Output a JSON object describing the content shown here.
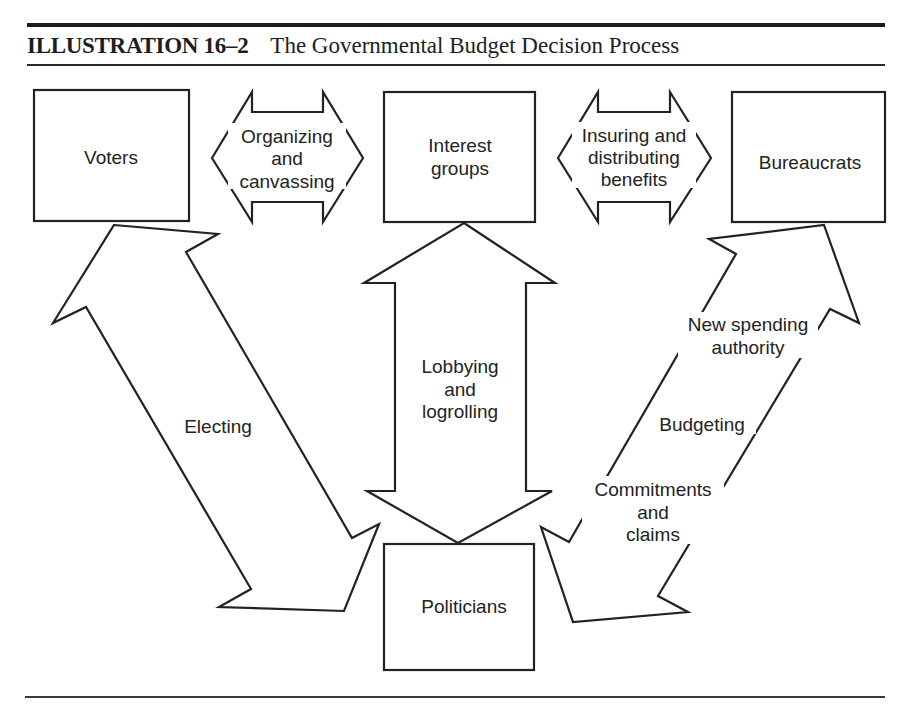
{
  "header": {
    "illustration_number": "ILLUSTRATION 16–2",
    "title": "The Governmental Budget Decision Process"
  },
  "nodes": {
    "voters": "Voters",
    "interest_groups": [
      "Interest",
      "groups"
    ],
    "bureaucrats": "Bureaucrats",
    "politicians": "Politicians"
  },
  "arrows": {
    "organizing": [
      "Organizing",
      "and",
      "canvassing"
    ],
    "insuring": [
      "Insuring and",
      "distributing",
      "benefits"
    ],
    "electing": "Electing",
    "lobbying": [
      "Lobbying",
      "and",
      "logrolling"
    ],
    "budgeting": {
      "top": [
        "New spending",
        "authority"
      ],
      "middle": "Budgeting",
      "bottom": [
        "Commitments",
        "and",
        "claims"
      ]
    }
  },
  "colors": {
    "ink": "#222222",
    "paper": "#ffffff"
  }
}
